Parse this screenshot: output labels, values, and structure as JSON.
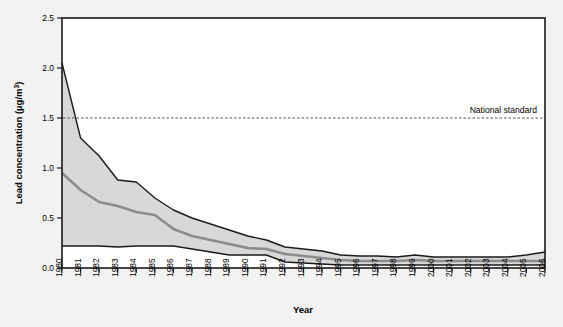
{
  "figure": {
    "background_color": "#f2f2f2",
    "plot_background_color": "#ffffff",
    "border_color": "#1a1a1a"
  },
  "chart_data": {
    "type": "area",
    "title": "",
    "subtitle": "",
    "xlabel": "Year",
    "ylabel": "Lead concentration (µg/m³)",
    "ylabel_main": "Lead concentration (",
    "ylabel_unit_pre": "µg/m",
    "ylabel_unit_sup": "3",
    "ylabel_tail": ")",
    "xlim": [
      1980,
      2006
    ],
    "ylim": [
      0.0,
      2.5
    ],
    "grid": false,
    "legend_position": "none",
    "ytick_labels": [
      "0.0",
      "0.5",
      "1.0",
      "1.5",
      "2.0",
      "2.5"
    ],
    "ytick_values": [
      0.0,
      0.5,
      1.0,
      1.5,
      2.0,
      2.5
    ],
    "categories": [
      1980,
      1981,
      1982,
      1983,
      1984,
      1985,
      1986,
      1987,
      1988,
      1989,
      1990,
      1991,
      1992,
      1993,
      1994,
      1995,
      1996,
      1997,
      1998,
      1999,
      2000,
      2001,
      2002,
      2003,
      2004,
      2005,
      2006
    ],
    "xtick_labels": [
      "1980",
      "1981",
      "1982",
      "1983",
      "1984",
      "1985",
      "1986",
      "1987",
      "1988",
      "1989",
      "1990",
      "1991",
      "1992",
      "1993",
      "1994",
      "1995",
      "1996",
      "1997",
      "1998",
      "1999",
      "2000",
      "2001",
      "2002",
      "2003",
      "2004",
      "2005",
      "2006"
    ],
    "band_fill_color": "#d8d8d8",
    "band_edge_color": "#1a1a1a",
    "median_line_color": "#8c8c8c",
    "series": [
      {
        "name": "90th percentile (upper bound)",
        "role": "band-upper",
        "values": [
          2.05,
          1.3,
          1.12,
          0.88,
          0.86,
          0.7,
          0.58,
          0.5,
          0.44,
          0.38,
          0.32,
          0.28,
          0.21,
          0.19,
          0.17,
          0.13,
          0.12,
          0.12,
          0.11,
          0.13,
          0.11,
          0.11,
          0.11,
          0.11,
          0.11,
          0.13,
          0.16
        ]
      },
      {
        "name": "Mean (median line)",
        "role": "median",
        "values": [
          0.95,
          0.78,
          0.66,
          0.62,
          0.56,
          0.53,
          0.39,
          0.32,
          0.28,
          0.24,
          0.2,
          0.19,
          0.14,
          0.12,
          0.1,
          0.08,
          0.07,
          0.07,
          0.07,
          0.08,
          0.07,
          0.07,
          0.07,
          0.07,
          0.07,
          0.07,
          0.07
        ]
      },
      {
        "name": "10th percentile (lower bound)",
        "role": "band-lower",
        "values": [
          0.22,
          0.22,
          0.22,
          0.21,
          0.22,
          0.22,
          0.22,
          0.19,
          0.16,
          0.13,
          0.13,
          0.13,
          0.06,
          0.05,
          0.04,
          0.03,
          0.03,
          0.03,
          0.03,
          0.03,
          0.03,
          0.03,
          0.03,
          0.03,
          0.03,
          0.03,
          0.03
        ]
      }
    ],
    "annotations": [
      {
        "name": "national-standard",
        "label": "National standard",
        "value": 1.5,
        "style": "dashed-horizontal-line",
        "color": "#555555"
      }
    ]
  }
}
